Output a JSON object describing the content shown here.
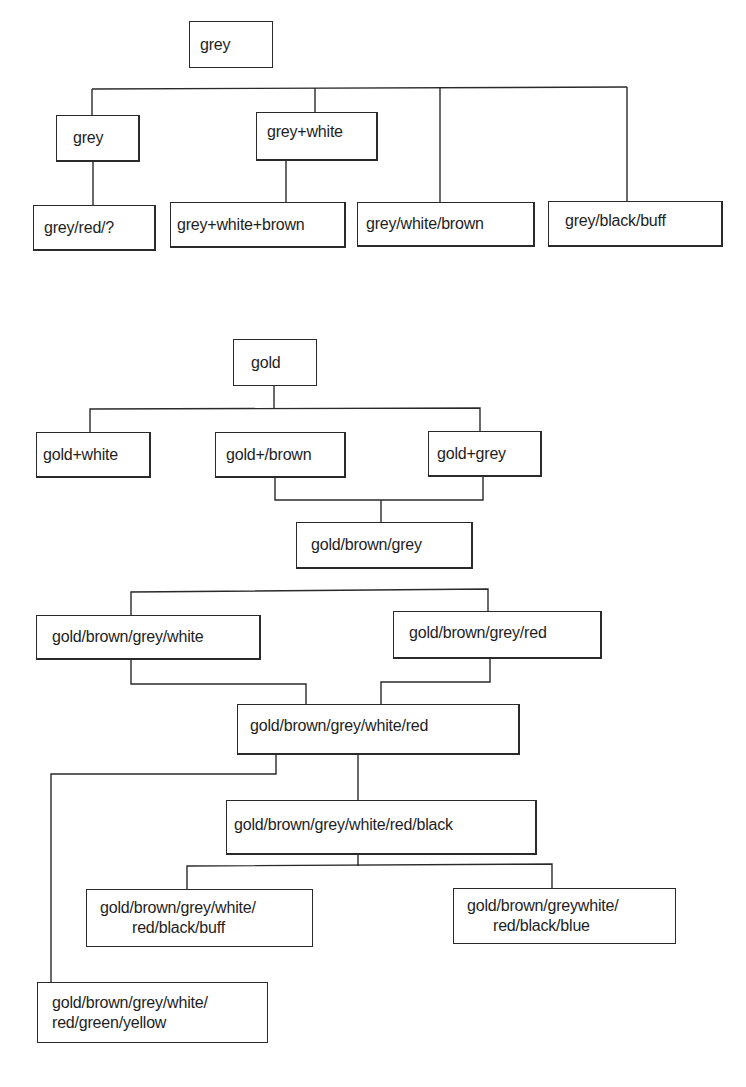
{
  "diagram": {
    "type": "tree",
    "trees": [
      {
        "name": "grey-tree",
        "root": "grey",
        "nodes": [
          {
            "id": "g0",
            "label": "grey"
          },
          {
            "id": "g1",
            "label": "grey"
          },
          {
            "id": "g2",
            "label": "grey+white"
          },
          {
            "id": "g3",
            "label": "grey/red/?"
          },
          {
            "id": "g4",
            "label": "grey+white+brown"
          },
          {
            "id": "g5",
            "label": "grey/white/brown"
          },
          {
            "id": "g6",
            "label": "grey/black/buff"
          }
        ],
        "edges": [
          [
            "g0",
            "g1"
          ],
          [
            "g0",
            "g2"
          ],
          [
            "g0",
            "g5"
          ],
          [
            "g0",
            "g6"
          ],
          [
            "g1",
            "g3"
          ],
          [
            "g2",
            "g4"
          ]
        ]
      },
      {
        "name": "gold-tree",
        "root": "gold",
        "nodes": [
          {
            "id": "d0",
            "label": "gold"
          },
          {
            "id": "d1",
            "label": "gold+white"
          },
          {
            "id": "d2",
            "label": "gold+/brown"
          },
          {
            "id": "d3",
            "label": "gold+grey"
          },
          {
            "id": "d4",
            "label": "gold/brown/grey"
          },
          {
            "id": "d5",
            "label": "gold/brown/grey/white"
          },
          {
            "id": "d6",
            "label": "gold/brown/grey/red"
          },
          {
            "id": "d7",
            "label": "gold/brown/grey/white/red"
          },
          {
            "id": "d8",
            "label": "gold/brown/grey/white/red/black"
          },
          {
            "id": "d9",
            "lines": [
              "gold/brown/grey/white/",
              "red/black/buff"
            ]
          },
          {
            "id": "d10",
            "lines": [
              "gold/brown/greywhite/",
              "red/black/blue"
            ]
          },
          {
            "id": "d11",
            "lines": [
              "gold/brown/grey/white/",
              "red/green/yellow"
            ]
          }
        ],
        "edges": [
          [
            "d0",
            "d1"
          ],
          [
            "d0",
            "d2"
          ],
          [
            "d0",
            "d3"
          ],
          [
            "d2",
            "d4"
          ],
          [
            "d3",
            "d4"
          ],
          [
            "d4",
            "d5"
          ],
          [
            "d4",
            "d6"
          ],
          [
            "d5",
            "d7"
          ],
          [
            "d6",
            "d7"
          ],
          [
            "d7",
            "d8"
          ],
          [
            "d7",
            "d11"
          ],
          [
            "d8",
            "d9"
          ],
          [
            "d8",
            "d10"
          ]
        ]
      }
    ]
  }
}
